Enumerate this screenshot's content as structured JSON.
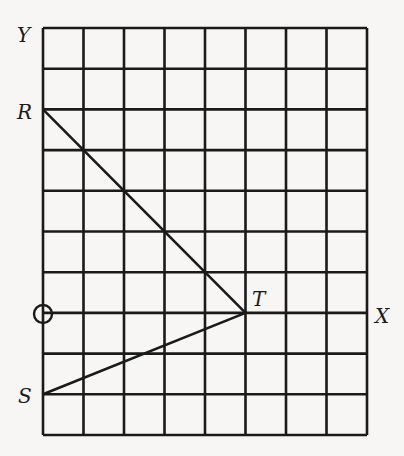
{
  "diagram": {
    "type": "coordinate-grid",
    "grid": {
      "columns": 8,
      "rows": 10,
      "origin_col": 0,
      "origin_row_from_top": 7,
      "line_color": "#1a1a1a",
      "background": "#f7f6f4"
    },
    "axes": {
      "y_label": "Y",
      "x_label": "X",
      "origin_marker": "circle"
    },
    "points": [
      {
        "label": "R",
        "x": 0,
        "y": 5
      },
      {
        "label": "T",
        "x": 5,
        "y": 0
      },
      {
        "label": "S",
        "x": 0,
        "y": -2
      }
    ],
    "segments": [
      {
        "from": "R",
        "to": "T"
      },
      {
        "from": "T",
        "to": "S"
      }
    ]
  }
}
